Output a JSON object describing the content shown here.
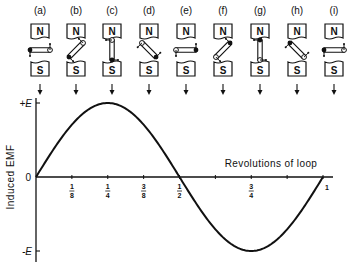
{
  "panels": [
    {
      "label": "(a)",
      "cx": 40,
      "angle": 0
    },
    {
      "label": "(b)",
      "cx": 76,
      "angle": 45
    },
    {
      "label": "(c)",
      "cx": 112,
      "angle": 90
    },
    {
      "label": "(d)",
      "cx": 149,
      "angle": 135
    },
    {
      "label": "(e)",
      "cx": 186,
      "angle": 180
    },
    {
      "label": "(f)",
      "cx": 223,
      "angle": 225
    },
    {
      "label": "(g)",
      "cx": 260,
      "angle": 270
    },
    {
      "label": "(h)",
      "cx": 297,
      "angle": 315
    },
    {
      "label": "(i)",
      "cx": 334,
      "angle": 360
    }
  ],
  "magnet": {
    "north": "N",
    "south": "S"
  },
  "graph": {
    "ylabel": "Induced EMF",
    "xlabel": "Revolutions of loop",
    "origin_label": "0",
    "ymax_label": "+E",
    "ymin_label": "-E",
    "xticks": [
      "1/8",
      "1/4",
      "3/8",
      "1/2",
      "3/4",
      "1"
    ]
  },
  "chart_data": {
    "type": "line",
    "title": "",
    "xlabel": "Revolutions of loop",
    "ylabel": "Induced EMF",
    "x": [
      0,
      0.125,
      0.25,
      0.375,
      0.5,
      0.625,
      0.75,
      0.875,
      1
    ],
    "series": [
      {
        "name": "EMF",
        "values": [
          0,
          0.707,
          1,
          0.707,
          0,
          -0.707,
          -1,
          -0.707,
          0
        ]
      }
    ],
    "xlim": [
      0,
      1
    ],
    "ylim": [
      -1,
      1
    ],
    "ytick_labels": [
      "-E",
      "0",
      "+E"
    ],
    "xtick_labels": [
      "1/8",
      "1/4",
      "3/8",
      "1/2",
      "3/4",
      "1"
    ],
    "grid": false
  }
}
